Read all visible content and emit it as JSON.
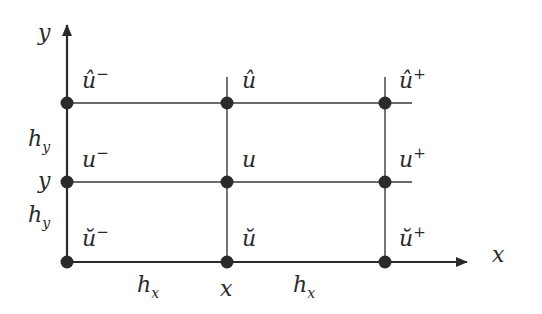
{
  "diagram": {
    "type": "finite-difference-stencil-grid",
    "colors": {
      "line": "#3a3a3a",
      "node": "#2b2b2b",
      "text": "#2a2a2a",
      "background": "#ffffff"
    },
    "axes": {
      "x_label": "x",
      "y_label": "y"
    },
    "spacing_labels": {
      "hx_left": "h",
      "hx_left_sub": "x",
      "hx_right": "h",
      "hx_right_sub": "x",
      "hy_top": "h",
      "hy_top_sub": "y",
      "hy_bottom": "h",
      "hy_bottom_sub": "y"
    },
    "tick_labels": {
      "x_center": "x",
      "y_center": "y"
    },
    "nodes": {
      "top_left": {
        "base": "û",
        "sup": "−"
      },
      "top_center": {
        "base": "û",
        "sup": ""
      },
      "top_right": {
        "base": "û",
        "sup": "+"
      },
      "middle_left": {
        "base": "u",
        "sup": "−"
      },
      "middle_center": {
        "base": "u",
        "sup": ""
      },
      "middle_right": {
        "base": "u",
        "sup": "+"
      },
      "bottom_left": {
        "base": "ŭ",
        "sup": "−"
      },
      "bottom_center": {
        "base": "ŭ",
        "sup": ""
      },
      "bottom_right": {
        "base": "ŭ",
        "sup": "+"
      }
    }
  }
}
